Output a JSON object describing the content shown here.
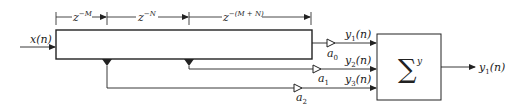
{
  "diagram": {
    "type": "block-diagram",
    "input": {
      "label": "x(n)"
    },
    "delay_line": {
      "segments": [
        {
          "label": "z",
          "exponent": "−M"
        },
        {
          "label": "z",
          "exponent": "−N"
        },
        {
          "label": "z",
          "exponent": "−(M + N)"
        }
      ]
    },
    "taps": [
      {
        "gain": "a",
        "gain_sub": "0",
        "signal": "y",
        "signal_sub": "1",
        "signal_arg": "(n)"
      },
      {
        "gain": "a",
        "gain_sub": "1",
        "signal": "y",
        "signal_sub": "2",
        "signal_arg": "(n)"
      },
      {
        "gain": "a",
        "gain_sub": "2",
        "signal": "y",
        "signal_sub": "3",
        "signal_arg": "(n)"
      }
    ],
    "summer": {
      "symbol": "∑",
      "superscript": "y"
    },
    "output": {
      "label": "y",
      "label_sub": "1",
      "label_arg": "(n)"
    },
    "colors": {
      "stroke": "#222222",
      "background": "#ffffff"
    }
  }
}
